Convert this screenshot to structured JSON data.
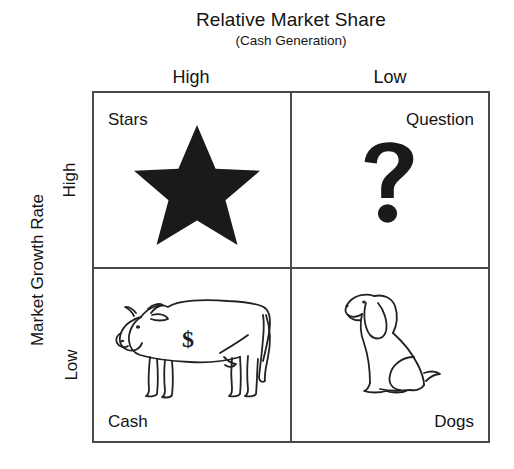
{
  "diagram": {
    "type": "bcg-growth-share-matrix",
    "x_axis": {
      "title": "Relative Market Share",
      "subtitle": "(Cash Generation)",
      "categories": [
        "High",
        "Low"
      ]
    },
    "y_axis": {
      "title": "Market Growth Rate",
      "categories": [
        "High",
        "Low"
      ]
    },
    "quadrants": [
      {
        "key": "stars",
        "label": "Stars",
        "position": "top-left",
        "market_share": "High",
        "growth_rate": "High",
        "icon": "star-icon",
        "icon_style": "solid-black-five-pointed-star"
      },
      {
        "key": "question",
        "label": "Question",
        "position": "top-right",
        "market_share": "Low",
        "growth_rate": "High",
        "icon": "question-mark-icon",
        "icon_style": "bold-black-question-mark"
      },
      {
        "key": "cash",
        "label": "Cash",
        "position": "bottom-left",
        "market_share": "High",
        "growth_rate": "Low",
        "icon": "cash-cow-icon",
        "icon_style": "line-drawn-cow-with-dollar-sign",
        "icon_annotation": "$"
      },
      {
        "key": "dogs",
        "label": "Dogs",
        "position": "bottom-right",
        "market_share": "Low",
        "growth_rate": "Low",
        "icon": "dog-icon",
        "icon_style": "line-drawn-sitting-dog"
      }
    ],
    "colors": {
      "background": "#ffffff",
      "border": "#4a4a4a",
      "text": "#141414",
      "art_fill": "#1a1a1a",
      "art_stroke": "#222222"
    }
  }
}
